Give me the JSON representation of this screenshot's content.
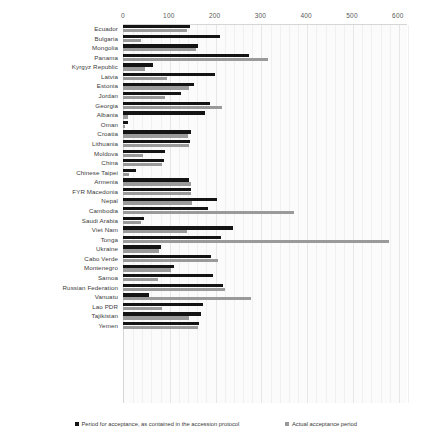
{
  "chart_data": {
    "type": "bar",
    "orientation": "horizontal",
    "title": "",
    "xlabel": "",
    "ylabel": "",
    "xlim": [
      0,
      620
    ],
    "xticks": [
      0,
      100,
      200,
      300,
      400,
      500,
      600
    ],
    "grid": true,
    "legend_position": "bottom",
    "colors": {
      "protocol": "#141414",
      "actual": "#9a9a9a"
    },
    "series": [
      {
        "name": "Period for acceptance, as contained in the accession protocol",
        "key": "protocol",
        "color": "#141414"
      },
      {
        "name": "Actual acceptance period",
        "key": "actual",
        "color": "#9a9a9a"
      }
    ],
    "categories": [
      "Ecuador",
      "Bulgaria",
      "Mongolia",
      "Panama",
      "Kyrgyz Republic",
      "Latvia",
      "Estonia",
      "Jordan",
      "Georgia",
      "Albania",
      "Oman",
      "Croatia",
      "Lithuania",
      "Moldova",
      "China",
      "Chinese Taipei",
      "Armenia",
      "FYR Macedonia",
      "Nepal",
      "Cambodia",
      "Saudi Arabia",
      "Viet Nam",
      "Tonga",
      "Ukraine",
      "Cabo Verde",
      "Montenegro",
      "Samoa",
      "Russian Federation",
      "Vanuatu",
      "Lao PDR",
      "Tajikistan",
      "Yemen"
    ],
    "values": {
      "protocol": [
        147,
        212,
        164,
        275,
        66,
        201,
        156,
        126,
        190,
        178,
        12,
        148,
        146,
        92,
        89,
        28,
        143,
        148,
        205,
        186,
        46,
        240,
        213,
        84,
        192,
        112,
        197,
        218,
        56,
        175,
        170,
        166
      ],
      "actual": [
        139,
        40,
        159,
        317,
        49,
        95,
        145,
        91,
        216,
        11,
        5,
        141,
        143,
        43,
        86,
        14,
        148,
        149,
        150,
        374,
        40,
        140,
        580,
        79,
        207,
        104,
        76,
        222,
        280,
        86,
        143,
        163
      ]
    }
  },
  "legend": {
    "protocol_label": "Period for acceptance, as contained in the accession protocol",
    "actual_label": "Actual acceptance period"
  }
}
